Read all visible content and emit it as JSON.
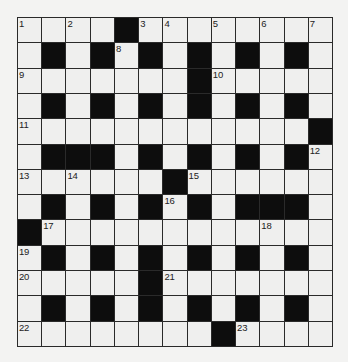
{
  "puzzle": {
    "rows": 13,
    "cols": 13,
    "colors": {
      "background": "#f3f3f2",
      "cell": "#efefee",
      "block": "#0d0d0d",
      "border": "#2a2a2a"
    },
    "grid": [
      [
        "1",
        "",
        "2",
        "",
        "#",
        "3",
        "4",
        "",
        "5",
        "",
        "6",
        "",
        "7"
      ],
      [
        "",
        "#",
        "",
        "#",
        "8",
        "#",
        "",
        "#",
        "",
        "#",
        "",
        "#",
        ""
      ],
      [
        "9",
        "",
        "",
        "",
        "",
        "",
        "",
        "#",
        "10",
        "",
        "",
        "",
        ""
      ],
      [
        "",
        "#",
        "",
        "#",
        "",
        "#",
        "",
        "#",
        "",
        "#",
        "",
        "#",
        ""
      ],
      [
        "11",
        "",
        "",
        "",
        "",
        "",
        "",
        "",
        "",
        "",
        "",
        "",
        "#"
      ],
      [
        "",
        "#",
        "#",
        "#",
        "",
        "#",
        "",
        "#",
        "",
        "#",
        "",
        "#",
        "12"
      ],
      [
        "13",
        "",
        "14",
        "",
        "",
        "",
        "#",
        "15",
        "",
        "",
        "",
        "",
        ""
      ],
      [
        "",
        "#",
        "",
        "#",
        "",
        "#",
        "16",
        "#",
        "",
        "#",
        "#",
        "#",
        ""
      ],
      [
        "#",
        "17",
        "",
        "",
        "",
        "",
        "",
        "",
        "",
        "",
        "18",
        "",
        ""
      ],
      [
        "19",
        "#",
        "",
        "#",
        "",
        "#",
        "",
        "#",
        "",
        "#",
        "",
        "#",
        ""
      ],
      [
        "20",
        "",
        "",
        "",
        "",
        "#",
        "21",
        "",
        "",
        "",
        "",
        "",
        ""
      ],
      [
        "",
        "#",
        "",
        "#",
        "",
        "#",
        "",
        "#",
        "",
        "#",
        "",
        "#",
        ""
      ],
      [
        "22",
        "",
        "",
        "",
        "",
        "",
        "",
        "",
        "#",
        "23",
        "",
        "",
        ""
      ]
    ],
    "clue_numbers": [
      "1",
      "2",
      "3",
      "4",
      "5",
      "6",
      "7",
      "8",
      "9",
      "10",
      "11",
      "12",
      "13",
      "14",
      "15",
      "16",
      "17",
      "18",
      "19",
      "20",
      "21",
      "22",
      "23"
    ]
  }
}
